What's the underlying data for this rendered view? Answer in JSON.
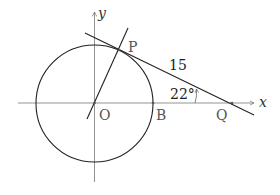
{
  "figure": {
    "type": "geometry",
    "axes": {
      "x_label": "x",
      "y_label": "y"
    },
    "points": {
      "O": "O",
      "P": "P",
      "B": "B",
      "Q": "Q"
    },
    "annotations": {
      "segment_PQ_length": "15",
      "angle_at_Q": "22°"
    },
    "colors": {
      "stroke": "#222222",
      "axis": "#777777",
      "label": "#555555"
    }
  }
}
